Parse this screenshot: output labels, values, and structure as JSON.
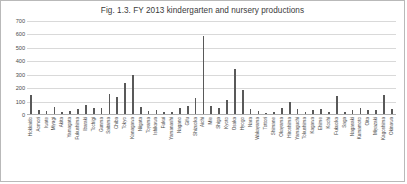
{
  "figure": {
    "title": "Fig. 1.3. FY 2013 kindergarten and nursery productions",
    "border_color": "#b9b9b9",
    "bar_color": "#595959",
    "grid_color": "#d9d9d9"
  },
  "chart_data": {
    "type": "bar",
    "title": "Fig. 1.3. FY 2013 kindergarten and nursery productions",
    "xlabel": "",
    "ylabel": "",
    "ylim": [
      0,
      700
    ],
    "yticks": [
      0,
      100,
      200,
      300,
      400,
      500,
      600,
      700
    ],
    "ytick_labels": [
      "0",
      "100",
      "200",
      "300",
      "400",
      "500",
      "600",
      "700"
    ],
    "grid": true,
    "legend": false,
    "categories": [
      "Hokkaido",
      "Aomori",
      "Iwate",
      "Miyagi",
      "Akita",
      "Yamagata",
      "Fukushima",
      "Ibaraki",
      "Tochigi",
      "Gunma",
      "Saitama",
      "Chiba",
      "Tokyo",
      "Kanagawa",
      "Niigata",
      "Toyama",
      "Ishikawa",
      "Fukui",
      "Yamanashi",
      "Nagano",
      "Gifu",
      "Shizuoka",
      "Aichi",
      "Mie",
      "Shiga",
      "Kyoto",
      "Osaka",
      "Hyogo",
      "Nara",
      "Wakayama",
      "Tottori",
      "Shimane",
      "Okayama",
      "Hiroshima",
      "Yamaguchi",
      "Tokushima",
      "Kagawa",
      "Ehime",
      "Kochi",
      "Fukuoka",
      "Saga",
      "Nagasaki",
      "Kumamoto",
      "Oita",
      "Miyazaki",
      "Kagoshima",
      "Okinawa"
    ],
    "values": [
      150,
      35,
      30,
      60,
      25,
      30,
      45,
      75,
      50,
      55,
      160,
      135,
      240,
      300,
      60,
      30,
      40,
      25,
      20,
      55,
      70,
      130,
      590,
      65,
      55,
      110,
      345,
      190,
      45,
      30,
      15,
      20,
      55,
      95,
      45,
      25,
      35,
      45,
      25,
      140,
      25,
      35,
      50,
      40,
      35,
      150,
      45
    ]
  }
}
